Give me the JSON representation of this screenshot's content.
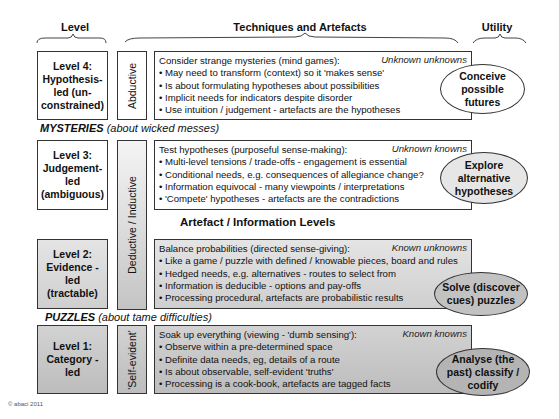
{
  "headers": {
    "level": "Level",
    "techniques": "Techniques and Artefacts",
    "utility": "Utility"
  },
  "sections": {
    "mysteries": {
      "title": "MYSTERIES",
      "subtitle": "(about wicked messes)"
    },
    "artefact_levels": "Artefact / Information Levels",
    "puzzles": {
      "title": "PUZZLES",
      "subtitle": "(about tame difficulties)"
    }
  },
  "reasoning": {
    "abductive": "Abductive",
    "deductive_inductive": "Deductive / Inductive",
    "self_evident": "'Self-evident'"
  },
  "levels": [
    {
      "label_lines": [
        "Level 4:",
        "Hypothesis-",
        "led (un-",
        "constrained)"
      ],
      "knowledge": "Unknown unknowns",
      "lines": [
        "Consider strange mysteries (mind games):",
        "• May need to transform (context) so it 'makes sense'",
        "• Is about formulating hypotheses about possibilities",
        "• Implicit needs for indicators despite disorder",
        "• Use intuition / judgement - artefacts are the hypotheses"
      ],
      "utility_lines": [
        "Conceive",
        "possible",
        "futures"
      ]
    },
    {
      "label_lines": [
        "Level 3:",
        "Judgement-",
        "led",
        "(ambiguous)"
      ],
      "knowledge": "Unknown knowns",
      "lines": [
        "Test hypotheses (purposeful sense-making):",
        "• Multi-level tensions / trade-offs - engagement is essential",
        "• Conditional needs, e.g. consequences of allegiance change?",
        "• Information equivocal - many viewpoints / interpretations",
        "• 'Compete' hypotheses  - artefacts are the contradictions"
      ],
      "utility_lines": [
        "Explore",
        "alternative",
        "hypotheses"
      ]
    },
    {
      "label_lines": [
        "Level 2:",
        "Evidence -",
        "led",
        "(tractable)"
      ],
      "knowledge": "Known unknowns",
      "lines": [
        "Balance probabilities (directed sense-giving):",
        "• Like a game / puzzle with defined / knowable pieces, board and rules",
        "• Hedged needs, e.g. alternatives - routes to select from",
        "• Information is deducible - options and pay-offs",
        "• Processing procedural, artefacts are probabilistic results"
      ],
      "utility_lines": [
        "Solve (discover",
        "cues) puzzles"
      ]
    },
    {
      "label_lines": [
        "Level 1:",
        "Category -",
        "led"
      ],
      "knowledge": "Known knowns",
      "lines": [
        "Soak up everything (viewing - 'dumb sensing'):",
        "• Observe within a pre-determined space",
        "• Definite data needs, eg, details of a route",
        "• Is about observable, self-evident 'truths'",
        "• Processing is a cook-book, artefacts are tagged facts"
      ],
      "utility_lines": [
        "Analyse (the",
        "past) classify /",
        "codify"
      ]
    }
  ],
  "copyright": "© abaci 2011",
  "colors": {
    "border": "#333333",
    "light_grey": "#dcdcdc",
    "mid_grey": "#c4c4c4",
    "white": "#ffffff"
  }
}
